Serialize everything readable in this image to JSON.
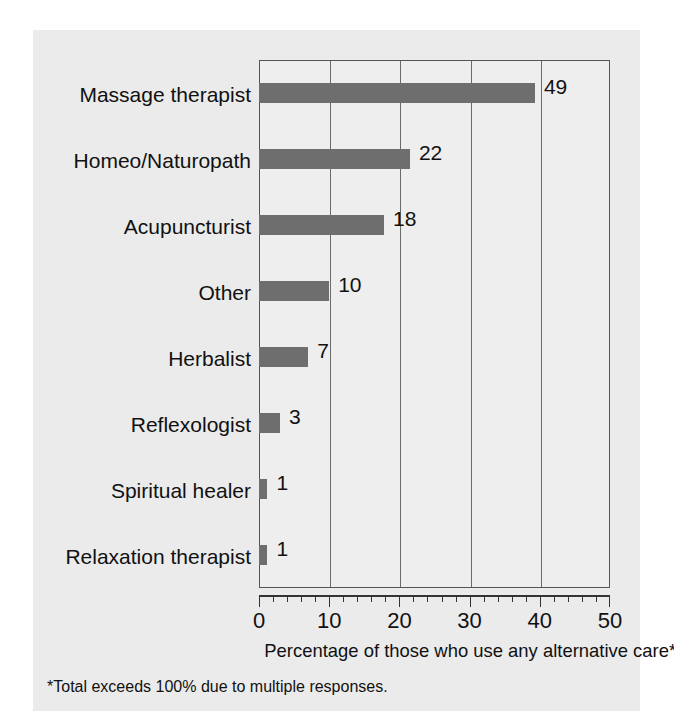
{
  "chart_data": {
    "type": "bar",
    "orientation": "horizontal",
    "title": "",
    "xlabel": "Percentage of those who use any alternative care*",
    "ylabel": "",
    "xlim": [
      0,
      50
    ],
    "xticks": [
      0,
      10,
      20,
      30,
      40,
      50
    ],
    "xtick_labels": [
      "0",
      "10",
      "20",
      "30",
      "40",
      "50"
    ],
    "minor_tick_step": 2,
    "grid": "vertical",
    "legend": "none",
    "categories": [
      "Massage therapist",
      "Homeo/Naturopath",
      "Acupuncturist",
      "Other",
      "Herbalist",
      "Reflexologist",
      "Spiritual healer",
      "Relaxation therapist"
    ],
    "values": [
      49,
      22,
      18,
      10,
      7,
      3,
      1,
      1
    ],
    "value_labels": [
      "49",
      "22",
      "18",
      "10",
      "7",
      "3",
      "1",
      "1"
    ],
    "drawn_lengths": [
      39.3,
      21.5,
      17.8,
      10.0,
      7.0,
      3.0,
      1.2,
      1.2
    ],
    "footnote": "*Total exceeds 100% due to multiple responses.",
    "bar_color": "#6e6e6e",
    "plot_background": "#eeeeee",
    "card_background": "#ebebeb",
    "page_background": "#ffffff",
    "axis_color": "#555555",
    "grid_color": "#6b6b6b",
    "text_color": "#111111"
  }
}
